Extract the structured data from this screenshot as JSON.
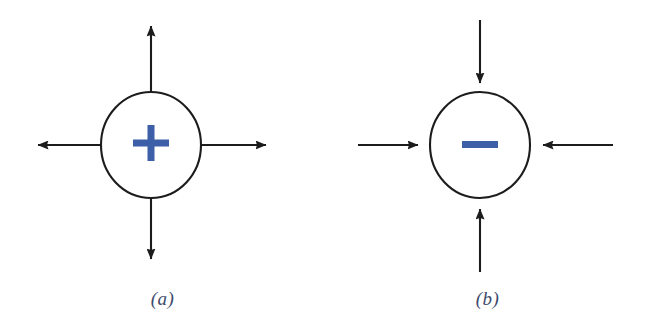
{
  "figure": {
    "background_color": "#ffffff",
    "stroke_color": "#1c1c1c",
    "sign_color": "#3c5fa8",
    "caption_color": "#3d4a6b",
    "panels": [
      {
        "id": "a",
        "caption": "(a)",
        "charge_sign": "+",
        "charge_sign_name": "plus-sign",
        "field_direction": "outward",
        "circle": {
          "cx": 151,
          "cy": 145,
          "rx": 50,
          "ry": 53
        },
        "arrows": [
          {
            "name": "arrow-up",
            "direction": "up",
            "from_x": 151,
            "from_y": 92,
            "to_x": 151,
            "to_y": 18
          },
          {
            "name": "arrow-right",
            "direction": "right",
            "from_x": 201,
            "from_y": 145,
            "to_x": 275,
            "to_y": 145
          },
          {
            "name": "arrow-down",
            "direction": "down",
            "from_x": 151,
            "from_y": 198,
            "to_x": 151,
            "to_y": 268
          },
          {
            "name": "arrow-left",
            "direction": "left",
            "from_x": 101,
            "from_y": 145,
            "to_x": 28,
            "to_y": 145
          }
        ]
      },
      {
        "id": "b",
        "caption": "(b)",
        "charge_sign": "−",
        "charge_sign_name": "minus-sign",
        "field_direction": "inward",
        "circle": {
          "cx": 480,
          "cy": 145,
          "rx": 50,
          "ry": 53
        },
        "arrows": [
          {
            "name": "arrow-down-into-circle",
            "direction": "down",
            "from_x": 480,
            "from_y": 20,
            "to_x": 480,
            "to_y": 90
          },
          {
            "name": "arrow-left-into-circle",
            "direction": "left",
            "from_x": 613,
            "from_y": 145,
            "to_x": 534,
            "to_y": 145
          },
          {
            "name": "arrow-up-into-circle",
            "direction": "up",
            "from_x": 480,
            "from_y": 272,
            "to_x": 480,
            "to_y": 200
          },
          {
            "name": "arrow-right-into-circle",
            "direction": "right",
            "from_x": 358,
            "from_y": 145,
            "to_x": 427,
            "to_y": 145
          }
        ]
      }
    ]
  }
}
